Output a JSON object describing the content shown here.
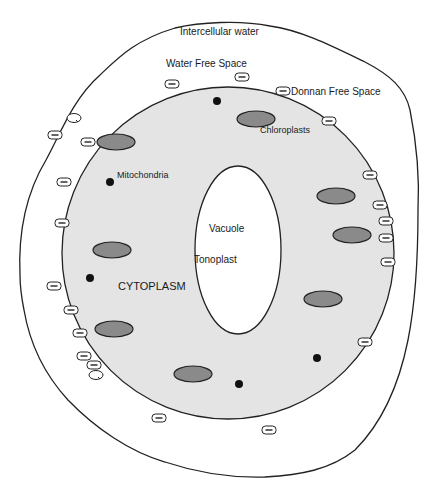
{
  "diagram": {
    "colors": {
      "background": "#ffffff",
      "outline": "#222222",
      "cytoplasm": "#e4e4e4",
      "chloroplast": "#8a8a8a",
      "mitochondria": "#111111",
      "vacuole": "#ffffff",
      "charge_fill": "#ffffff"
    },
    "labels": {
      "intercellular_water": "Intercellular water",
      "water_free_space": "Water Free Space",
      "donnan_free_space": "Donnan Free Space",
      "chloroplasts": "Chloroplasts",
      "mitochondria": "Mitochondria",
      "vacuole": "Vacuole",
      "tonoplast": "Tonoplast",
      "cytoplasm": "CYTOPLASM"
    },
    "charge_symbol": "−",
    "chloroplasts": [
      {
        "cx": 256,
        "cy": 119,
        "rx": 19,
        "ry": 8
      },
      {
        "cx": 116,
        "cy": 142,
        "rx": 19,
        "ry": 8
      },
      {
        "cx": 336,
        "cy": 196,
        "rx": 19,
        "ry": 8
      },
      {
        "cx": 352,
        "cy": 235,
        "rx": 19,
        "ry": 8
      },
      {
        "cx": 112,
        "cy": 250,
        "rx": 19,
        "ry": 8
      },
      {
        "cx": 323,
        "cy": 299,
        "rx": 19,
        "ry": 8
      },
      {
        "cx": 114,
        "cy": 329,
        "rx": 19,
        "ry": 8
      },
      {
        "cx": 193,
        "cy": 374,
        "rx": 19,
        "ry": 8
      }
    ],
    "mitochondria": [
      {
        "cx": 217,
        "cy": 101,
        "r": 4
      },
      {
        "cx": 110,
        "cy": 182,
        "r": 4
      },
      {
        "cx": 90,
        "cy": 278,
        "r": 4
      },
      {
        "cx": 317,
        "cy": 358,
        "r": 4
      },
      {
        "cx": 239,
        "cy": 384,
        "r": 4
      }
    ],
    "charges": [
      {
        "x": 172,
        "y": 84
      },
      {
        "x": 242,
        "y": 77
      },
      {
        "x": 283,
        "y": 91
      },
      {
        "x": 329,
        "y": 121
      },
      {
        "x": 55,
        "y": 135
      },
      {
        "x": 88,
        "y": 142
      },
      {
        "x": 64,
        "y": 182
      },
      {
        "x": 370,
        "y": 175
      },
      {
        "x": 380,
        "y": 205
      },
      {
        "x": 386,
        "y": 221
      },
      {
        "x": 386,
        "y": 238
      },
      {
        "x": 62,
        "y": 223
      },
      {
        "x": 388,
        "y": 262
      },
      {
        "x": 54,
        "y": 286
      },
      {
        "x": 71,
        "y": 310
      },
      {
        "x": 80,
        "y": 333
      },
      {
        "x": 84,
        "y": 356
      },
      {
        "x": 94,
        "y": 365
      },
      {
        "x": 365,
        "y": 342
      },
      {
        "x": 159,
        "y": 418
      },
      {
        "x": 269,
        "y": 430
      }
    ],
    "bound_ions": [
      {
        "x": 74,
        "y": 118
      },
      {
        "x": 96,
        "y": 375
      }
    ]
  }
}
